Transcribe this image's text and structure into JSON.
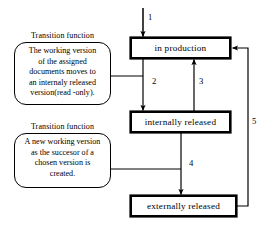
{
  "diagram": {
    "type": "state-transition",
    "states": [
      {
        "id": "in-production",
        "label": "in production"
      },
      {
        "id": "internally-released",
        "label": "internally released"
      },
      {
        "id": "externally-released",
        "label": "externally released"
      }
    ],
    "transitions": [
      {
        "number": "1",
        "from": "",
        "to": "in production"
      },
      {
        "number": "2",
        "from": "in production",
        "to": "internally released"
      },
      {
        "number": "3",
        "from": "internally released",
        "to": "in production"
      },
      {
        "number": "4",
        "from": "internally released",
        "to": "externally released"
      },
      {
        "number": "5",
        "from": "externally released",
        "to": "in production"
      }
    ],
    "callouts": [
      {
        "id": "internal-release",
        "title": "Transition function",
        "attached_to": "2",
        "lines": [
          "The working version",
          "of the assigned",
          "documents moves to",
          "an internaly released",
          "version(read -only)."
        ]
      },
      {
        "id": "successor-version",
        "title": "Transition function",
        "attached_to": "4",
        "lines": [
          "A new working version",
          "as the succesor of a",
          "chosen version is",
          "created."
        ]
      }
    ],
    "colors": {
      "stroke": "#000000",
      "background": "#ffffff"
    }
  }
}
